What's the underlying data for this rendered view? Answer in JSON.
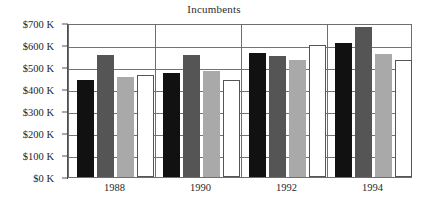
{
  "chart_data": {
    "type": "bar",
    "title": "Incumbents",
    "xlabel": "",
    "ylabel": "",
    "categories": [
      "1988",
      "1990",
      "1992",
      "1994"
    ],
    "series": [
      {
        "name": "Series 1",
        "color": "#111111",
        "values": [
          440,
          475,
          565,
          608
        ]
      },
      {
        "name": "Series 2",
        "color": "#555555",
        "values": [
          555,
          553,
          550,
          682
        ]
      },
      {
        "name": "Series 3",
        "color": "#a9a9a9",
        "values": [
          455,
          482,
          533,
          557
        ]
      },
      {
        "name": "Series 4",
        "color": "#ffffff",
        "values": [
          465,
          442,
          600,
          530
        ]
      }
    ],
    "ylim": [
      0,
      700
    ],
    "ytick_values": [
      0,
      100,
      200,
      300,
      400,
      500,
      600,
      700
    ],
    "ytick_labels": [
      "$0 K",
      "$100 K",
      "$200 K",
      "$300 K",
      "$400 K",
      "$500 K",
      "$600 K",
      "$700 K"
    ],
    "unit": "K",
    "currency": "$",
    "grid": true,
    "legend": "none",
    "group_separators": true,
    "axis_color": "#6e6e6e",
    "grid_color": "#737373"
  }
}
